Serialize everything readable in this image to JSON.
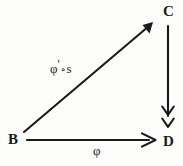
{
  "diagram": {
    "kind": "commutative-triangle",
    "width": 183,
    "height": 166,
    "background_color": "#fdfdfb",
    "ink_color": "#1a1a1a",
    "vertices": [
      {
        "id": "B",
        "label": "B",
        "x": 20,
        "y": 140,
        "position": "bottom-left"
      },
      {
        "id": "C",
        "label": "C",
        "x": 168,
        "y": 12,
        "position": "top-right"
      },
      {
        "id": "D",
        "label": "D",
        "x": 168,
        "y": 143,
        "position": "bottom-right"
      }
    ],
    "edges": [
      {
        "id": "b-to-c",
        "from": "B",
        "to": "C",
        "label": "φ'∘s",
        "label_parts": {
          "phi": "φ",
          "prime": "'",
          "circ": "∘",
          "s": "s"
        },
        "arrowhead": "single",
        "orientation": "diagonal",
        "x1": 24,
        "y1": 132,
        "x2": 152,
        "y2": 23
      },
      {
        "id": "b-to-d",
        "from": "B",
        "to": "D",
        "label": "φ",
        "arrowhead": "single",
        "orientation": "horizontal",
        "x1": 27,
        "y1": 140,
        "x2": 155,
        "y2": 140
      },
      {
        "id": "c-to-d",
        "from": "C",
        "to": "D",
        "label": "",
        "arrowhead": "double",
        "arrow_meaning": "epimorphism",
        "orientation": "vertical",
        "x1": 168,
        "y1": 26,
        "x2": 168,
        "y2": 128
      }
    ]
  }
}
